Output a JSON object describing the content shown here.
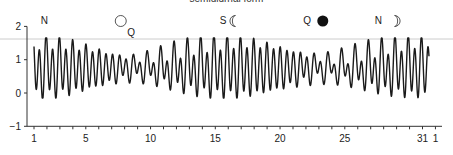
{
  "chart_data": {
    "type": "line",
    "title": "semidiurnal form",
    "xlabel": "",
    "ylabel": "",
    "xlim": [
      1,
      32
    ],
    "ylim": [
      -1,
      2
    ],
    "grid": false,
    "x_tick_labels": [
      "1",
      "5",
      "10",
      "15",
      "20",
      "25",
      "31",
      "1"
    ],
    "x_tick_days": [
      1,
      5,
      10,
      15,
      20,
      25,
      31,
      32
    ],
    "y_ticks": [
      -1,
      0,
      1,
      2
    ],
    "reference_line_y": 1.6,
    "annotations": [
      {
        "label": "N",
        "day": 1.8,
        "symbol": null
      },
      {
        "label": "Q",
        "day": 8.5,
        "symbol": "full-moon",
        "symbol_day": 7.7
      },
      {
        "label": "S",
        "day": 15.6,
        "symbol": "first-quarter-moon",
        "symbol_day": 16.4
      },
      {
        "label": "Q",
        "day": 22.1,
        "symbol": "new-moon",
        "symbol_day": 23.3
      },
      {
        "label": "N",
        "day": 27.6,
        "symbol": "last-quarter-moon",
        "symbol_day": 29.0
      }
    ],
    "series": [
      {
        "name": "tide height",
        "description": "Mixed semidiurnal tide, two highs and two lows per day over one month",
        "x_days": [
          1,
          1.25,
          1.5,
          1.75,
          2,
          2.25,
          2.5,
          2.75,
          3,
          3.25,
          3.5,
          3.75,
          4,
          4.25,
          4.5,
          4.75,
          5,
          5.25,
          5.5,
          5.75,
          6,
          6.25,
          6.5,
          6.75,
          7,
          7.25,
          7.5,
          7.75,
          8,
          8.25,
          8.5,
          8.75,
          9,
          9.25,
          9.5,
          9.75,
          10,
          10.25,
          10.5,
          10.75,
          11,
          11.25,
          11.5,
          11.75,
          12,
          12.25,
          12.5,
          12.75,
          13,
          13.25,
          13.5,
          13.75,
          14,
          14.25,
          14.5,
          14.75,
          15,
          15.25,
          15.5,
          15.75,
          16,
          16.25,
          16.5,
          16.75,
          17,
          17.25,
          17.5,
          17.75,
          18,
          18.25,
          18.5,
          18.75,
          19,
          19.25,
          19.5,
          19.75,
          20,
          20.25,
          20.5,
          20.75,
          21,
          21.25,
          21.5,
          21.75,
          22,
          22.25,
          22.5,
          22.75,
          23,
          23.25,
          23.5,
          23.75,
          24,
          24.25,
          24.5,
          24.75,
          25,
          25.25,
          25.5,
          25.75,
          26,
          26.25,
          26.5,
          26.75,
          27,
          27.25,
          27.5,
          27.75,
          28,
          28.25,
          28.5,
          28.75,
          29,
          29.25,
          29.5,
          29.75,
          30,
          30.25,
          30.5,
          30.75,
          31,
          31.25,
          31.5
        ],
        "high_low_range": {
          "max_high": 1.65,
          "min_low": -0.15
        }
      }
    ]
  },
  "labels": {
    "title": "semidiurnal form",
    "y_axis": [
      "2",
      "1",
      "0",
      "−1"
    ],
    "x_axis": [
      "1",
      "5",
      "10",
      "15",
      "20",
      "25",
      "31",
      "1"
    ],
    "phase_letters": [
      "N",
      "Q",
      "S",
      "Q",
      "N"
    ]
  },
  "colors": {
    "line": "#1a1a1a",
    "axis": "#333333",
    "reference_line": "#cccccc",
    "text": "#222222"
  }
}
